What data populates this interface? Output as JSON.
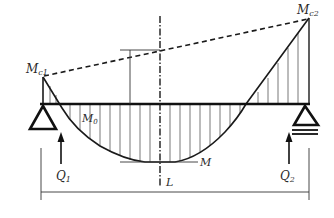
{
  "diagram": {
    "type": "beam-bending-moment-diagram",
    "labels": {
      "mc1": "M",
      "mc1_sub": "c1",
      "mc2": "M",
      "mc2_sub": "c2",
      "m0": "M",
      "m0_sub": "0",
      "m": "M",
      "q1": "Q",
      "q1_sub": "1",
      "q2": "Q",
      "q2_sub": "2",
      "l": "L"
    },
    "elements": {
      "beam": "horizontal beam on two supports",
      "left_support": "triangle pin support",
      "right_support": "triangle roller support with double base line",
      "closing_line": "dashed line from Mc1 to Mc2",
      "centerline": "dash-dot vertical axis of symmetry",
      "moment_curve": "parabolic hatched moment diagram M0",
      "reactions": [
        "Q1 upward arrow",
        "Q2 upward arrow"
      ],
      "span_dimension": "L"
    },
    "colors": {
      "line": "#1a1a1a",
      "hatch": "#555555",
      "background": "#ffffff"
    }
  }
}
